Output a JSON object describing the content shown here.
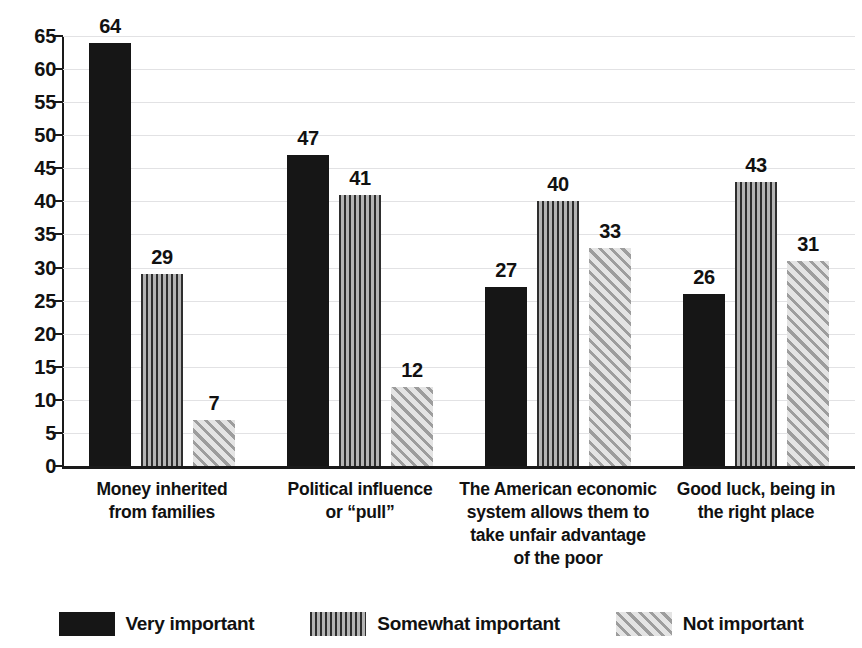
{
  "chart_data": {
    "type": "bar",
    "title": "",
    "subtitle": "",
    "xlabel": "",
    "ylabel": "",
    "ylim": [
      0,
      65
    ],
    "ytick_step": 5,
    "yticks": [
      0,
      5,
      10,
      15,
      20,
      25,
      30,
      35,
      40,
      45,
      50,
      55,
      60,
      65
    ],
    "grid": true,
    "grid_axis": "y",
    "legend_position": "bottom",
    "orientation": "vertical",
    "categories": [
      "Money inherited\nfrom families",
      "Political influence\nor “pull”",
      "The American economic\nsystem allows them to\ntake unfair advantage\nof the poor",
      "Good luck, being in\nthe right place"
    ],
    "series": [
      {
        "name": "Very important",
        "pattern": "solid",
        "color": "#161616",
        "values": [
          64,
          47,
          27,
          26
        ]
      },
      {
        "name": "Somewhat important",
        "pattern": "vertical-stripes",
        "color": "#6e6e6e",
        "values": [
          29,
          41,
          40,
          43
        ]
      },
      {
        "name": "Not important",
        "pattern": "diagonal-hatch",
        "color": "#bcbcbc",
        "values": [
          7,
          12,
          33,
          31
        ]
      }
    ]
  },
  "axis": {
    "y_tick_labels": [
      "0",
      "5",
      "10",
      "15",
      "20",
      "25",
      "30",
      "35",
      "40",
      "45",
      "50",
      "55",
      "60",
      "65"
    ]
  },
  "categories_display": [
    {
      "lines": [
        "Money inherited",
        "from families"
      ]
    },
    {
      "lines": [
        "Political influence",
        "or “pull”"
      ]
    },
    {
      "lines": [
        "The American economic",
        "system allows them to",
        "take unfair advantage",
        "of the poor"
      ]
    },
    {
      "lines": [
        "Good luck, being in",
        "the right place"
      ]
    }
  ],
  "value_labels": {
    "group0": [
      "64",
      "29",
      "7"
    ],
    "group1": [
      "47",
      "41",
      "12"
    ],
    "group2": [
      "27",
      "40",
      "33"
    ],
    "group3": [
      "26",
      "43",
      "31"
    ]
  },
  "legend": {
    "items": [
      {
        "label": "Very important"
      },
      {
        "label": "Somewhat important"
      },
      {
        "label": "Not important"
      }
    ]
  },
  "colors": {
    "very_important": "#161616",
    "somewhat_important": "#6e6e6e",
    "not_important": "#bcbcbc",
    "gridline": "#e2e2e4",
    "axis": "#1a1a1a",
    "text": "#111111",
    "background": "#ffffff"
  }
}
